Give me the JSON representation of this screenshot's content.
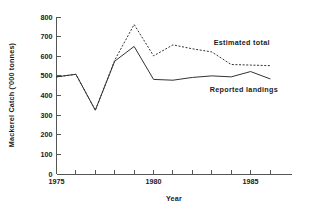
{
  "chart_data": {
    "type": "line",
    "title": "",
    "subtitle": "",
    "xlabel": "Year",
    "ylabel": "Mackerel Catch ('000 tonnes)",
    "x": [
      1975,
      1976,
      1977,
      1978,
      1979,
      1980,
      1981,
      1982,
      1983,
      1984,
      1985,
      1986
    ],
    "xlim": [
      1975,
      1986
    ],
    "ylim": [
      0,
      800
    ],
    "xticks": [
      1975,
      1976,
      1977,
      1978,
      1979,
      1980,
      1981,
      1982,
      1983,
      1984,
      1985,
      1986
    ],
    "xtick_labels": [
      "1975",
      "",
      "",
      "",
      "",
      "1980",
      "",
      "",
      "",
      "",
      "1985",
      ""
    ],
    "yticks": [
      0,
      100,
      200,
      300,
      400,
      500,
      600,
      700,
      800
    ],
    "ytick_labels": [
      "0",
      "100",
      "200",
      "300",
      "400",
      "500",
      "600",
      "700",
      "800"
    ],
    "grid": false,
    "legend_position": "inline-annotation",
    "series": [
      {
        "name": "Estimated total",
        "style": "dashed",
        "color": "#333333",
        "label_x": 1983.1,
        "label_y": 655,
        "values": [
          495,
          508,
          325,
          580,
          762,
          602,
          658,
          638,
          622,
          558,
          555,
          552
        ]
      },
      {
        "name": "Reported landings",
        "style": "solid",
        "color": "#333333",
        "label_x": 1982.9,
        "label_y": 418,
        "values": [
          495,
          508,
          325,
          575,
          650,
          482,
          478,
          492,
          500,
          495,
          522,
          485
        ]
      }
    ]
  },
  "axes": {
    "y_axis_label": "Mackerel Catch ('000 tonnes)",
    "x_axis_label": "Year"
  }
}
